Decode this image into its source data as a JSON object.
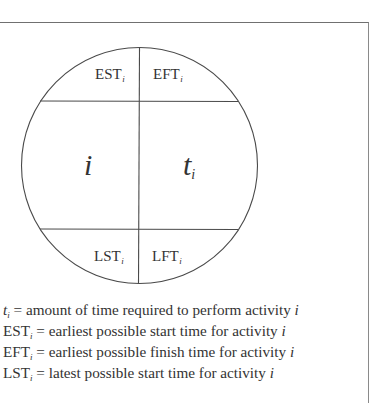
{
  "diagram": {
    "node": {
      "top_left": {
        "base": "EST",
        "sub": "i"
      },
      "top_right": {
        "base": "EFT",
        "sub": "i"
      },
      "middle_left": {
        "base": "i"
      },
      "middle_right": {
        "base": "t",
        "sub": "i"
      },
      "bottom_left": {
        "base": "LST",
        "sub": "i"
      },
      "bottom_right": {
        "base": "LFT",
        "sub": "i"
      }
    },
    "legend": [
      {
        "symbol": "t",
        "sub": "i",
        "text": " = amount of time required to perform activity ",
        "var": "i"
      },
      {
        "symbol": "EST",
        "sub": "i",
        "text": " = earliest possible start time for activity ",
        "var": "i"
      },
      {
        "symbol": "EFT",
        "sub": "i",
        "text": " = earliest possible finish time for activity ",
        "var": "i"
      },
      {
        "symbol": "LST",
        "sub": "i",
        "text": " = latest possible start time for activity ",
        "var": "i"
      }
    ],
    "colors": {
      "line": "#4a4a4a",
      "frame": "#707070",
      "text": "#333333"
    }
  }
}
